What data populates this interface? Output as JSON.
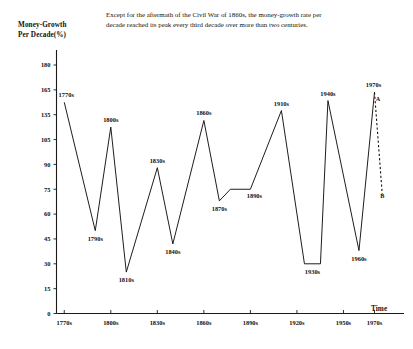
{
  "caption": "Except for the aftermath of the Civil War of 1860s, the money-growth rate per decade reached its peak every third decade over more than two centuries.",
  "y_axis_title": "Money-Growth\nPer Decade(%)",
  "x_axis_title": "Time",
  "chart_data": {
    "type": "line",
    "title": "Except for the aftermath of the Civil War of 1860s, the money-growth rate per decade reached its peak every third decade over more than two centuries.",
    "xlabel": "Time",
    "ylabel": "Money-Growth Per Decade(%)",
    "grid": false,
    "legend": "none",
    "ylim": [
      0,
      180
    ],
    "y_ticks": [
      0,
      15,
      30,
      45,
      60,
      75,
      90,
      105,
      135,
      165,
      180
    ],
    "x_ticks": [
      "1770s",
      "1800s",
      "1830s",
      "1860s",
      "1890s",
      "1920s",
      "1950s",
      "1970s"
    ],
    "x_tick_positions": [
      1770,
      1800,
      1830,
      1860,
      1890,
      1920,
      1950,
      1970
    ],
    "point_labels": [
      "1770s",
      "1790s",
      "1800s",
      "1810s",
      "1830s",
      "1840s",
      "1860s",
      "1870s",
      "1890s",
      "1910s",
      "1930s",
      "1940s",
      "1960s",
      "1970s"
    ],
    "x": [
      1770,
      1790,
      1800,
      1810,
      1830,
      1840,
      1860,
      1870,
      1890,
      1910,
      1930,
      1940,
      1960,
      1970
    ],
    "values": [
      150,
      50,
      120,
      25,
      88,
      42,
      128,
      68,
      75,
      140,
      30,
      152,
      38,
      162
    ],
    "series": [
      {
        "name": "Money growth rate per decade",
        "values": [
          150,
          50,
          120,
          25,
          88,
          42,
          128,
          68,
          75,
          140,
          30,
          152,
          38,
          162
        ]
      }
    ],
    "flat_segments": [
      {
        "from": "1870s",
        "to": "1890s",
        "note": "plateau"
      },
      {
        "from": "1930s",
        "to": "1930s",
        "note": "flat trough"
      }
    ],
    "annotations": [
      {
        "label": "A",
        "x": 1970,
        "value": 162,
        "note": "start of dashed projection at 1970s peak"
      },
      {
        "label": "B",
        "x": 1975,
        "value": 72,
        "note": "end of dashed projection"
      }
    ],
    "projection": {
      "style": "dashed",
      "from": "A",
      "to": "B"
    }
  }
}
